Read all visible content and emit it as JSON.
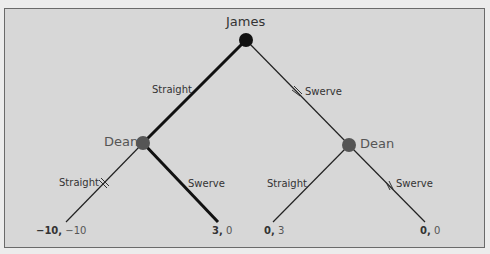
{
  "tree": {
    "root": {
      "player": "James"
    },
    "branches": {
      "james_straight": "Straight",
      "james_swerve": "Swerve",
      "dean_left_straight": "Straight",
      "dean_left_swerve": "Swerve",
      "dean_right_straight": "Straight",
      "dean_right_swerve": "Swerve"
    },
    "dean_left": {
      "player": "Dean"
    },
    "dean_right": {
      "player": "Dean"
    },
    "payoffs": [
      {
        "james": "−10,",
        "dean": "−10"
      },
      {
        "james": "3,",
        "dean": "0"
      },
      {
        "james": "0,",
        "dean": "3"
      },
      {
        "james": "0,",
        "dean": "0"
      }
    ]
  },
  "colors": {
    "background": "#d7d7d7",
    "equilibrium_path": "#111111",
    "node_james": "#111111",
    "node_dean": "#555555"
  }
}
